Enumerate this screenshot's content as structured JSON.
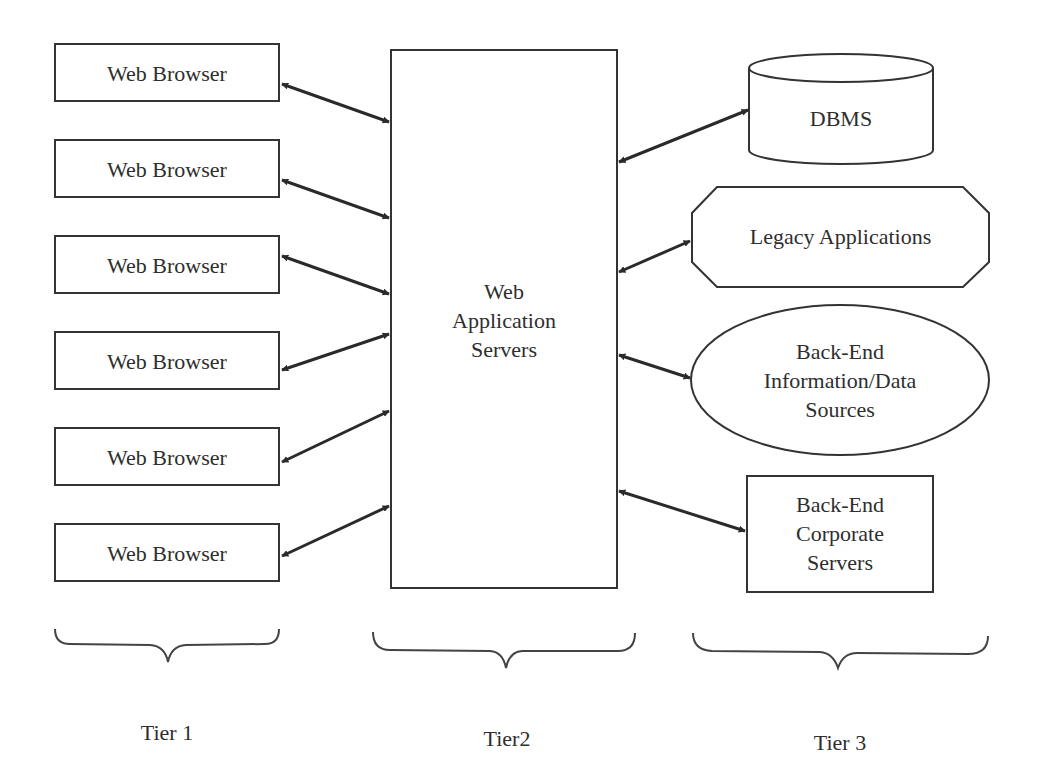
{
  "tier1": {
    "label": "Tier 1",
    "clients": [
      {
        "label": "Web Browser"
      },
      {
        "label": "Web Browser"
      },
      {
        "label": "Web Browser"
      },
      {
        "label": "Web Browser"
      },
      {
        "label": "Web Browser"
      },
      {
        "label": "Web Browser"
      }
    ]
  },
  "tier2": {
    "label": "Tier2",
    "server": {
      "line1": "Web",
      "line2": "Application",
      "line3": "Servers"
    }
  },
  "tier3": {
    "label": "Tier 3",
    "dbms": {
      "label": "DBMS",
      "shape": "cylinder"
    },
    "legacy": {
      "label": "Legacy Applications",
      "shape": "octagon"
    },
    "info_sources": {
      "line1": "Back-End",
      "line2": "Information/Data",
      "line3": "Sources",
      "shape": "ellipse"
    },
    "corporate": {
      "line1": "Back-End",
      "line2": "Corporate",
      "line3": "Servers",
      "shape": "rectangle"
    }
  },
  "colors": {
    "stroke": "#333333",
    "arrow": "#2a2a2a",
    "background": "#ffffff"
  }
}
